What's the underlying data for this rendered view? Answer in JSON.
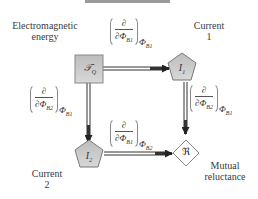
{
  "diagram": {
    "nodes": {
      "energy": {
        "symbol": "𝒯",
        "subscript": "Q",
        "label": "Electromagnetic energy",
        "label_line1": "Electromagnetic",
        "label_line2": "energy",
        "shape": "square"
      },
      "current1": {
        "symbol": "I",
        "subscript": "1",
        "label_line1": "Current",
        "label_line2": "1",
        "shape": "pentagon"
      },
      "current2": {
        "symbol": "I",
        "subscript": "2",
        "label_line1": "Current",
        "label_line2": "2",
        "shape": "pentagon"
      },
      "reluctance": {
        "symbol": "ℜ",
        "label_line1": "Mutual",
        "label_line2": "reluctance",
        "shape": "diamond"
      }
    },
    "edges": [
      {
        "from": "energy",
        "to": "current1",
        "operator": {
          "numerator": "∂",
          "denominator": "∂Φ",
          "den_sub": "B1",
          "outer": "Φ",
          "outer_sub": "B1"
        }
      },
      {
        "from": "energy",
        "to": "current2",
        "operator": {
          "numerator": "∂",
          "denominator": "∂Φ",
          "den_sub": "B2",
          "outer": "Φ",
          "outer_sub": "B1"
        }
      },
      {
        "from": "current1",
        "to": "reluctance",
        "operator": {
          "numerator": "∂",
          "denominator": "∂Φ",
          "den_sub": "B2",
          "outer": "Φ",
          "outer_sub": "B1"
        }
      },
      {
        "from": "current2",
        "to": "reluctance",
        "operator": {
          "numerator": "∂",
          "denominator": "∂Φ",
          "den_sub": "B1",
          "outer": "Φ",
          "outer_sub": "B2"
        }
      }
    ]
  },
  "colors": {
    "node_fill": "#c8c8c8",
    "node_stroke": "#777777",
    "edge": "#333333",
    "diamond_fill": "#ffffff"
  }
}
